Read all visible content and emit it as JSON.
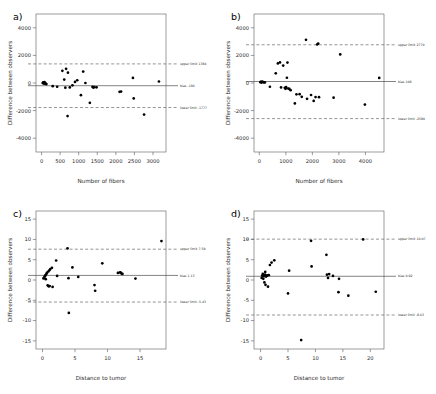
{
  "figure": {
    "panel_count": 4,
    "background": "#ffffff",
    "point_color": "#000000",
    "line_color": "#4d4d4d"
  },
  "chart_data": [
    {
      "type": "scatter",
      "panel": "a)",
      "title": "",
      "xlabel": "Number of fibers",
      "ylabel": "Difference between observers",
      "xlim": [
        -150,
        3350
      ],
      "ylim": [
        -5000,
        5000
      ],
      "xticks": [
        0,
        500,
        1000,
        1500,
        2000,
        2500,
        3000
      ],
      "xticklabels": [
        "0",
        "500",
        "1000",
        "1500",
        "2000",
        "2500",
        "3000"
      ],
      "yticks": [
        4000,
        2000,
        0,
        -2000,
        -4000
      ],
      "yticklabels": [
        "4000",
        "2000",
        "0",
        "-2000",
        "-4000"
      ],
      "grid": false,
      "bias": -196,
      "upper_limit": 1384,
      "lower_limit": -1777,
      "annotations": [
        {
          "label": "upper limit  1384",
          "value": 1384
        },
        {
          "label": "bias  -196",
          "value": -196
        },
        {
          "label": "lower limit  -1777",
          "value": -1777
        }
      ],
      "x": [
        30,
        45,
        55,
        60,
        70,
        75,
        85,
        95,
        110,
        130,
        300,
        420,
        560,
        610,
        640,
        660,
        700,
        710,
        760,
        830,
        900,
        960,
        1060,
        1120,
        1180,
        1300,
        1370,
        1390,
        1420,
        1480,
        2100,
        2140,
        2460,
        2480,
        2760,
        3160
      ],
      "y": [
        0,
        40,
        -30,
        20,
        -10,
        60,
        -20,
        10,
        -60,
        -80,
        -230,
        -270,
        880,
        250,
        -340,
        1030,
        -2400,
        750,
        -320,
        -170,
        80,
        200,
        -880,
        830,
        0,
        -1440,
        -270,
        -330,
        -300,
        -310,
        -640,
        -620,
        370,
        -1120,
        -2290,
        110
      ]
    },
    {
      "type": "scatter",
      "panel": "b)",
      "title": "",
      "xlabel": "Number of fibers",
      "ylabel": "Difference between observers",
      "xlim": [
        -200,
        4700
      ],
      "ylim": [
        -5000,
        5000
      ],
      "xticks": [
        0,
        1000,
        2000,
        3000,
        4000
      ],
      "xticklabels": [
        "0",
        "1000",
        "2000",
        "3000",
        "4000"
      ],
      "yticks": [
        4000,
        2000,
        0,
        -2000,
        -4000
      ],
      "yticklabels": [
        "4000",
        "2000",
        "0",
        "-2000",
        "-4000"
      ],
      "grid": false,
      "bias": 108,
      "upper_limit": 2770,
      "lower_limit": -2580,
      "annotations": [
        {
          "label": "upper limit  2770",
          "value": 2770
        },
        {
          "label": "bias  108",
          "value": 108
        },
        {
          "label": "lower limit  -2580",
          "value": -2580
        }
      ],
      "x": [
        40,
        60,
        80,
        110,
        140,
        170,
        210,
        400,
        620,
        700,
        780,
        820,
        900,
        960,
        990,
        1010,
        1040,
        1060,
        1090,
        1130,
        1180,
        1340,
        1400,
        1520,
        1600,
        1760,
        1800,
        1950,
        2050,
        2120,
        2180,
        2220,
        2250,
        2800,
        3050,
        3980,
        4520
      ],
      "y": [
        60,
        90,
        30,
        110,
        70,
        50,
        40,
        -270,
        700,
        1420,
        1490,
        -320,
        1260,
        -350,
        -420,
        -300,
        380,
        1480,
        -400,
        -430,
        -520,
        -1480,
        -820,
        -810,
        -1000,
        3130,
        -1150,
        -870,
        -1300,
        -1020,
        2790,
        2860,
        -1030,
        -1060,
        2070,
        -1560,
        370
      ]
    },
    {
      "type": "scatter",
      "panel": "c)",
      "title": "",
      "xlabel": "Distance to tumor",
      "ylabel": "Difference between observers",
      "xlim": [
        -1,
        19
      ],
      "ylim": [
        -17,
        17
      ],
      "xticks": [
        0,
        5,
        10,
        15
      ],
      "xticklabels": [
        "0",
        "5",
        "10",
        "15"
      ],
      "yticks": [
        15,
        10,
        5,
        0,
        -5,
        -10,
        -15
      ],
      "yticklabels": [
        "15",
        "10",
        "5",
        "0",
        "-5",
        "-10",
        "-15"
      ],
      "grid": false,
      "bias": 1.13,
      "upper_limit": 7.59,
      "lower_limit": -5.43,
      "annotations": [
        {
          "label": "upper limit  7.59",
          "value": 7.59
        },
        {
          "label": "bias  1.13",
          "value": 1.13
        },
        {
          "label": "lower limit  -5.43",
          "value": -5.43
        }
      ],
      "x": [
        0.15,
        0.25,
        0.35,
        0.45,
        0.5,
        0.6,
        0.7,
        0.8,
        0.9,
        0.95,
        1.05,
        1.1,
        1.2,
        1.45,
        1.55,
        2.1,
        2.25,
        3.85,
        4.0,
        4.05,
        4.6,
        5.5,
        8.0,
        8.1,
        9.2,
        11.6,
        11.9,
        12.0,
        12.15,
        12.3,
        14.3,
        18.3
      ],
      "y": [
        0.4,
        0.6,
        0.9,
        1.2,
        0.2,
        1.5,
        1.8,
        -1.3,
        2.1,
        -1.55,
        2.4,
        -1.5,
        2.7,
        3.0,
        -1.7,
        4.8,
        1.0,
        7.8,
        0.45,
        -8.1,
        3.1,
        0.75,
        -1.25,
        -2.65,
        4.1,
        1.75,
        1.85,
        1.9,
        1.6,
        1.5,
        0.35,
        9.6
      ]
    },
    {
      "type": "scatter",
      "panel": "d)",
      "title": "",
      "xlabel": "Distance to tumor",
      "ylabel": "Difference between observers",
      "xlim": [
        -1.2,
        22.5
      ],
      "ylim": [
        -17,
        17
      ],
      "xticks": [
        0,
        5,
        10,
        15,
        20
      ],
      "xticklabels": [
        "0",
        "5",
        "10",
        "15",
        "20"
      ],
      "yticks": [
        15,
        10,
        5,
        0,
        -5,
        -10,
        -15
      ],
      "yticklabels": [
        "15",
        "10",
        "5",
        "0",
        "-5",
        "-10",
        "-15"
      ],
      "grid": false,
      "bias": 0.92,
      "upper_limit": 10.07,
      "lower_limit": -8.63,
      "annotations": [
        {
          "label": "upper limit  10.07",
          "value": 10.07
        },
        {
          "label": "bias  0.92",
          "value": 0.92
        },
        {
          "label": "lower limit  -8.63",
          "value": -8.63
        }
      ],
      "x": [
        0.2,
        0.3,
        0.4,
        0.5,
        0.6,
        0.7,
        0.8,
        0.85,
        0.9,
        1.0,
        1.1,
        1.2,
        1.35,
        1.5,
        1.7,
        2.0,
        2.5,
        5.0,
        5.2,
        7.4,
        9.2,
        9.3,
        12.0,
        12.1,
        12.3,
        12.5,
        13.2,
        14.2,
        14.3,
        16.0,
        18.7,
        21.0
      ],
      "y": [
        0.5,
        1.1,
        1.5,
        0.3,
        0.9,
        -0.6,
        1.3,
        2.0,
        -1.2,
        0.85,
        1.0,
        1.15,
        -1.65,
        1.2,
        3.7,
        4.3,
        4.85,
        -3.3,
        2.3,
        -14.8,
        9.65,
        3.35,
        6.2,
        1.3,
        0.5,
        1.45,
        1.0,
        -3.0,
        0.3,
        -3.85,
        10.0,
        -2.9
      ]
    }
  ]
}
